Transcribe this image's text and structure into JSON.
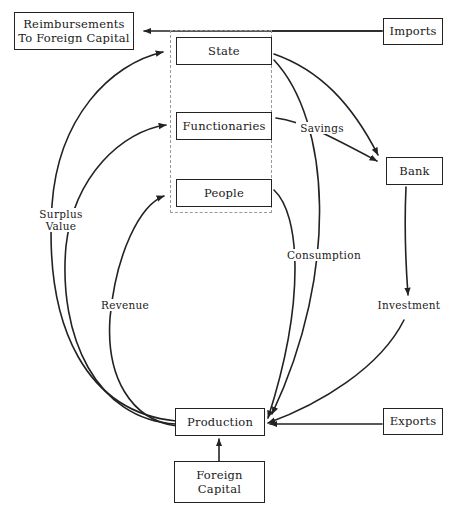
{
  "diagram": {
    "title_fragment": "",
    "type": "economic-circular-flow-diagram",
    "nodes": [
      {
        "id": "reimbursements",
        "label": "Reimbursements\nTo Foreign Capital"
      },
      {
        "id": "imports",
        "label": "Imports"
      },
      {
        "id": "state",
        "label": "State"
      },
      {
        "id": "functionaries",
        "label": "Functionaries"
      },
      {
        "id": "people",
        "label": "People"
      },
      {
        "id": "bank",
        "label": "Bank"
      },
      {
        "id": "production",
        "label": "Production"
      },
      {
        "id": "foreign_capital",
        "label": "Foreign\nCapital"
      },
      {
        "id": "exports",
        "label": "Exports"
      }
    ],
    "group": {
      "id": "domestic-sector",
      "label": "",
      "members": [
        "state",
        "functionaries",
        "people"
      ]
    },
    "edge_labels": [
      {
        "id": "surplus_value",
        "label": "Surplus\nValue"
      },
      {
        "id": "revenue",
        "label": "Revenue"
      },
      {
        "id": "savings",
        "label": "Savings"
      },
      {
        "id": "consumption",
        "label": "Consumption"
      },
      {
        "id": "investment",
        "label": "Investment"
      }
    ],
    "edges": [
      {
        "from": "imports",
        "to": "reimbursements",
        "label": ""
      },
      {
        "from": "production",
        "to": "state",
        "label": "Surplus Value"
      },
      {
        "from": "production",
        "to": "functionaries",
        "label": "Surplus Value"
      },
      {
        "from": "production",
        "to": "people",
        "label": "Revenue"
      },
      {
        "from": "state",
        "to": "bank",
        "label": "Savings"
      },
      {
        "from": "functionaries",
        "to": "bank",
        "label": "Savings"
      },
      {
        "from": "people",
        "to": "production",
        "label": "Consumption"
      },
      {
        "from": "state",
        "to": "production",
        "label": "Consumption"
      },
      {
        "from": "bank",
        "to": "production",
        "label": "Investment"
      },
      {
        "from": "exports",
        "to": "production",
        "label": ""
      },
      {
        "from": "foreign_capital",
        "to": "production",
        "label": ""
      }
    ],
    "colors": {
      "stroke": "#222222",
      "group_stroke": "#9a9a9a",
      "background": "#ffffff",
      "text": "#1a1a1a"
    }
  }
}
